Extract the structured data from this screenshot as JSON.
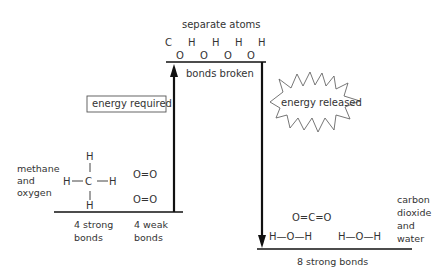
{
  "diagram": {
    "top": {
      "title": "separate atoms",
      "atoms_row1": [
        "C",
        "H",
        "H",
        "H",
        "H"
      ],
      "atoms_row2": [
        "O",
        "O",
        "O",
        "O"
      ],
      "level_label": "bonds broken"
    },
    "energy_required": "energy required",
    "energy_released": "energy released",
    "reactants": {
      "label_lines": [
        "methane",
        "and",
        "oxygen"
      ],
      "methane": {
        "top": "H",
        "left": "H",
        "center": "C",
        "right": "H",
        "bottom": "H"
      },
      "oxygen": [
        "O=O",
        "O=O"
      ],
      "bonds_left": [
        "4 strong",
        "bonds"
      ],
      "bonds_right": [
        "4 weak",
        "bonds"
      ]
    },
    "products": {
      "label_lines": [
        "carbon",
        "dioxide",
        "and",
        "water"
      ],
      "co2": "O=C=O",
      "water": [
        "H—O—H",
        "H—O—H"
      ],
      "bonds": "8 strong bonds"
    },
    "colors": {
      "line": "#111111",
      "text": "#333333"
    }
  }
}
